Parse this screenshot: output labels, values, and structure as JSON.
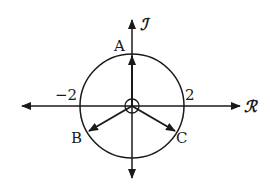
{
  "diagram": {
    "type": "complex-plane phasor diagram",
    "center": {
      "x": 132,
      "y": 106
    },
    "circle_radius_px": 52,
    "axes": {
      "real_label": "ℛ",
      "imag_label": "ℐ"
    },
    "ticks": {
      "neg": "−2",
      "pos": "2"
    },
    "phasors": [
      {
        "label": "A",
        "angle_deg": 90
      },
      {
        "label": "B",
        "angle_deg": 210
      },
      {
        "label": "C",
        "angle_deg": 330
      }
    ],
    "color": "#1a1a1a"
  }
}
